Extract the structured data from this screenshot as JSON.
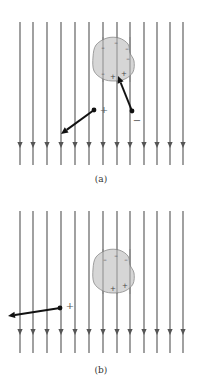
{
  "figure": {
    "colors": {
      "field_line": "#6e6e6e",
      "blob_fill": "#d0d0d0",
      "blob_stroke": "#8a8a8a",
      "arrow": "#111111",
      "charge_sign": "#444444"
    },
    "field_lines_x": [
      20,
      33,
      47,
      61,
      75,
      89,
      103,
      117,
      130,
      144,
      157,
      170,
      183
    ],
    "field_direction": "down"
  },
  "panels": [
    {
      "id": "a",
      "caption": "(a)",
      "line_top": 22,
      "arrowhead_y": 146,
      "line_bottom": 165,
      "blob": {
        "cx": 113,
        "cy": 59,
        "blob_signs": [
          {
            "x": 103,
            "y": 48,
            "s": "–"
          },
          {
            "x": 116,
            "y": 43,
            "s": "–"
          },
          {
            "x": 127,
            "y": 49,
            "s": "–"
          },
          {
            "x": 128,
            "y": 59,
            "s": "–"
          },
          {
            "x": 103,
            "y": 74,
            "s": "–"
          },
          {
            "x": 113,
            "y": 77,
            "s": "+"
          },
          {
            "x": 124,
            "y": 74,
            "s": "+"
          }
        ]
      },
      "charges": [
        {
          "label": "+",
          "x": 94,
          "y": 110,
          "label_x": 104,
          "label_y": 113,
          "arrow_to": [
            61,
            134
          ]
        },
        {
          "label": "−",
          "x": 132,
          "y": 111,
          "label_x": 137,
          "label_y": 124,
          "arrow_to": [
            118,
            76
          ]
        }
      ]
    },
    {
      "id": "b",
      "caption": "(b)",
      "line_top": 19,
      "arrowhead_y": 141,
      "line_bottom": 161,
      "blob": {
        "cx": 113,
        "cy": 79,
        "blob_signs": [
          {
            "x": 105,
            "y": 68,
            "s": "–"
          },
          {
            "x": 116,
            "y": 64,
            "s": "–"
          },
          {
            "x": 126,
            "y": 68,
            "s": "–"
          },
          {
            "x": 113,
            "y": 97,
            "s": "+"
          },
          {
            "x": 125,
            "y": 94,
            "s": "+"
          }
        ]
      },
      "charges": [
        {
          "label": "+",
          "x": 60,
          "y": 116,
          "label_x": 70,
          "label_y": 117,
          "arrow_to": [
            8,
            124
          ]
        }
      ]
    }
  ]
}
